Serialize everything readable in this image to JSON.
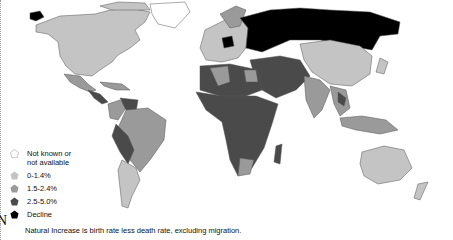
{
  "map": {
    "title": "Natural Increase",
    "colors": {
      "not_known": "#ffffff",
      "low": "#c4c4c4",
      "medium": "#9a9a9a",
      "high": "#4a4a4a",
      "decline": "#000000",
      "border": "#555555"
    }
  },
  "legend": {
    "items": [
      {
        "label_line1": "Not known or",
        "label_line2": "not available",
        "color": "#ffffff",
        "icon": "pentagon-outline-icon"
      },
      {
        "label_line1": "0-1.4%",
        "label_line2": "",
        "color": "#c4c4c4",
        "icon": "pentagon-icon"
      },
      {
        "label_line1": "1.5-2.4%",
        "label_line2": "",
        "color": "#9a9a9a",
        "icon": "pentagon-icon"
      },
      {
        "label_line1": "2.5-5.0%",
        "label_line2": "",
        "color": "#4a4a4a",
        "icon": "pentagon-icon"
      },
      {
        "label_line1": "Decline",
        "label_line2": "",
        "color": "#000000",
        "icon": "pentagon-icon"
      }
    ]
  },
  "note": "Natural Increase is birth rate less death rate, excluding migration.",
  "compass": {
    "letter": "N"
  }
}
